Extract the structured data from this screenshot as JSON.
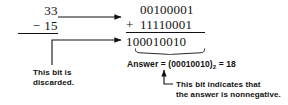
{
  "figure": {
    "background_color": "#ffffff",
    "ink_color": "#111111"
  },
  "decimal": {
    "minuend": "33",
    "operator": "−",
    "subtrahend": "15",
    "rule": true
  },
  "binary": {
    "addend_1": "00100001",
    "operator": "+",
    "addend_2": "11110001",
    "rule": true,
    "sum": "100010010",
    "discarded_bit": "1",
    "kept_bits": "00010010"
  },
  "answer": {
    "prefix": "Answer = (",
    "value": "00010010",
    "close_paren": ")",
    "base": "2",
    "equals": " = ",
    "decimal_value": "18",
    "full_text": "Answer = (00010010)2 = 18"
  },
  "annotations": {
    "discarded": {
      "line_1": "This bit is",
      "line_2": "discarded."
    },
    "nonnegative": {
      "line_1": "This bit indicates that",
      "line_2": "the answer is nonnegative."
    }
  },
  "arrows": {
    "convert_arrow": "horizontal-arrow-right",
    "discard_arrow": "elbow-arrow-up-right",
    "sign_arrow": "elbow-arrow-up-left"
  }
}
